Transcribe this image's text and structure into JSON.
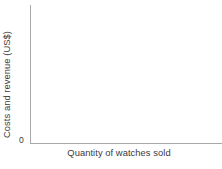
{
  "chart_data": {
    "type": "line",
    "title": "",
    "subtitle": "",
    "xlabel": "Quantity of watches sold",
    "ylabel": "Costs and revenue (US$)",
    "origin_label": "0",
    "series": [],
    "categories": [],
    "x": [],
    "values": [],
    "xticks": [],
    "yticks": [],
    "xlim": [
      0,
      null
    ],
    "ylim": [
      0,
      null
    ],
    "grid": false,
    "legend": null,
    "annotations": [],
    "axis_color": "#a9a9a9",
    "text_color": "#3b3b3b",
    "background_color": "#ffffff",
    "note": "Empty axes template with no plotted data"
  }
}
